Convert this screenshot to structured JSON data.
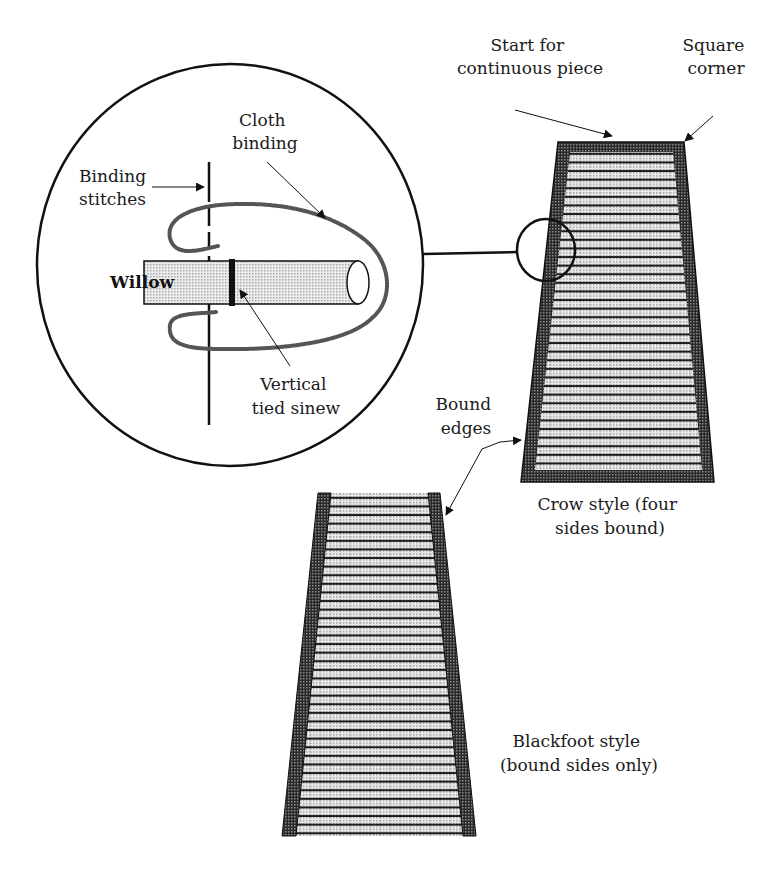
{
  "diagram": {
    "detail_view": {
      "labels": {
        "binding_stitches": [
          "Binding",
          "stitches"
        ],
        "cloth_binding": [
          "Cloth",
          "binding"
        ],
        "willow": "Willow",
        "vertical_tied_sinew": [
          "Vertical",
          "tied sinew"
        ]
      }
    },
    "crow_style": {
      "labels": {
        "start_for_continuous_piece": [
          "Start for",
          "continuous piece"
        ],
        "square_corner": [
          "Square",
          "corner"
        ],
        "bound_edges": [
          "Bound",
          "edges"
        ]
      },
      "caption": [
        "Crow style (four",
        "sides bound)"
      ]
    },
    "blackfoot_style": {
      "caption": [
        "Blackfoot style",
        "(bound sides only)"
      ]
    },
    "colors": {
      "ink": "#111111",
      "binding_fill": "#3a3a3a",
      "willow_fill": "#cfcfcf",
      "background": "#ffffff"
    }
  }
}
